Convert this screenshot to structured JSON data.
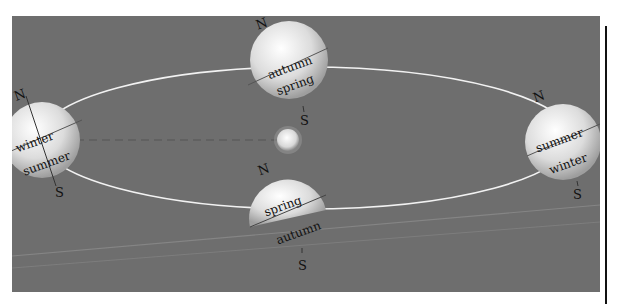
{
  "diagram": {
    "type": "earth-orbit-seasons",
    "colors": {
      "background": "#6e6e6e",
      "orbit": "#f2f2f2",
      "planet_light": "#ffffff",
      "planet_dark": "#a9a9a9",
      "text": "#111111"
    },
    "sun": {
      "label": ""
    },
    "positions": [
      {
        "id": "left",
        "north": "N",
        "south": "S",
        "upper": "winter",
        "lower": "summer"
      },
      {
        "id": "top",
        "north": "N",
        "south": "S",
        "upper": "autumn",
        "lower": "spring"
      },
      {
        "id": "bottom",
        "north": "N",
        "south": "S",
        "upper": "spring",
        "lower": "autumn"
      },
      {
        "id": "right",
        "north": "N",
        "south": "S",
        "upper": "summer",
        "lower": "winter"
      }
    ]
  }
}
